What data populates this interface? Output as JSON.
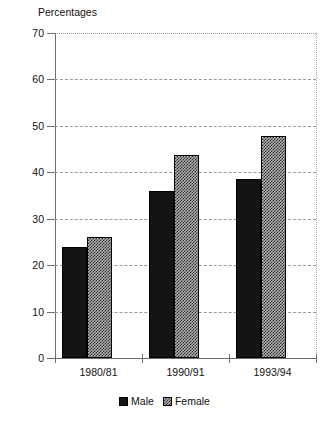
{
  "chart_data": {
    "type": "bar",
    "title": "Percentages",
    "xlabel": "",
    "ylabel": "",
    "categories": [
      "1980/81",
      "1990/91",
      "1993/94"
    ],
    "series": [
      {
        "name": "Male",
        "values": [
          24,
          36,
          38.5
        ],
        "pattern": "solid-black",
        "color": "#141414"
      },
      {
        "name": "Female",
        "values": [
          26,
          43.8,
          47.8
        ],
        "pattern": "checkered-hatch",
        "color": "#b4b4b4"
      }
    ],
    "ylim": [
      0,
      70
    ],
    "yticks": [
      0,
      10,
      20,
      30,
      40,
      50,
      60,
      70
    ],
    "ytick_labels": [
      "0",
      "10",
      "20",
      "30",
      "40",
      "50",
      "60",
      "70"
    ],
    "grid": true,
    "grid_style": "dashed-horizontal",
    "legend_position": "bottom-center"
  },
  "legend": {
    "entries": [
      {
        "label": "Male"
      },
      {
        "label": "Female"
      }
    ]
  },
  "colors": {
    "male": "#141414",
    "female": "#b4b4b4",
    "axis": "#6d6d6d",
    "grid": "#9a9a9a",
    "text": "#111111",
    "background": "#ffffff"
  }
}
